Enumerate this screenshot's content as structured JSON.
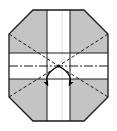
{
  "figure": {
    "type": "origami-fold-diagram",
    "canvas": {
      "width": 117,
      "height": 131,
      "background": "#ffffff"
    },
    "colors": {
      "paper_gray": "#c9c9c9",
      "paper_gray_dark": "#bdbdbd",
      "paper_white": "#ffffff",
      "outline": "#1a1a1a",
      "fold_dashed": "#1a1a1a",
      "center_axis": "#1a1a1a",
      "arrow": "#000000",
      "inner_crease": "#d8d8d8"
    },
    "geometry": {
      "octagon_points": "33,10 84,10 108,34 108,97 84,121 33,121 9,97 9,34",
      "horizontal_band": {
        "x": 9,
        "y": 53,
        "width": 99,
        "height": 26
      },
      "vertical_band": {
        "x": 47,
        "y": 10,
        "width": 23,
        "height": 111
      },
      "center": {
        "x": 58.5,
        "y": 66
      },
      "corner_vertices": [
        {
          "name": "top-left",
          "x": 9,
          "y": 34
        },
        {
          "name": "top-right",
          "x": 108,
          "y": 34
        },
        {
          "name": "bottom-right",
          "x": 108,
          "y": 97
        },
        {
          "name": "bottom-left",
          "x": 9,
          "y": 97
        }
      ]
    },
    "elements": {
      "outline_label": "octagon-outline",
      "gray_panels_label": "gray-corner-panels",
      "white_cross_label": "white-cross-bands",
      "dashed_label": "diagonal-fold-creases",
      "axis_label": "horizontal-center-axis",
      "arrows_label": "fold-direction-arrows"
    },
    "fold_lines": [
      {
        "name": "diagonal-top-left",
        "x1": 9,
        "y1": 34,
        "x2": 58.5,
        "y2": 66
      },
      {
        "name": "diagonal-top-right",
        "x1": 108,
        "y1": 34,
        "x2": 58.5,
        "y2": 66
      },
      {
        "name": "diagonal-bottom-right",
        "x1": 108,
        "y1": 97,
        "x2": 58.5,
        "y2": 66
      },
      {
        "name": "diagonal-bottom-left",
        "x1": 9,
        "y1": 97,
        "x2": 58.5,
        "y2": 66
      }
    ],
    "arrows": [
      {
        "name": "arrow-down-left",
        "path": "M 58.5 66 C 48 72 44 78 47.5 86",
        "tip": "47.5,86"
      },
      {
        "name": "arrow-down-right",
        "path": "M 58.5 66 C 69 72 73 78 69.5 86",
        "tip": "69.5,86"
      }
    ],
    "center_axis": {
      "name": "dash-dot-center-line",
      "x1": 9,
      "y1": 66,
      "x2": 108,
      "y2": 66,
      "pattern": "9,2,2,2"
    }
  }
}
